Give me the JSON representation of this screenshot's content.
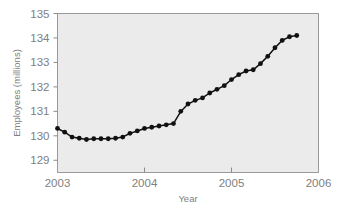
{
  "chart_data": {
    "type": "line",
    "title": "",
    "subtitle": "",
    "xlabel": "Year",
    "ylabel": "Employees (millions)",
    "xlim": [
      2003.0,
      2006.0
    ],
    "ylim": [
      128.5,
      135.0
    ],
    "xticks": [
      2003,
      2004,
      2005,
      2006
    ],
    "xtick_labels": [
      "2003",
      "2004",
      "2005",
      "2006"
    ],
    "yticks": [
      129,
      130,
      131,
      132,
      133,
      134,
      135
    ],
    "ytick_labels": [
      "129",
      "130",
      "131",
      "132",
      "133",
      "134",
      "135"
    ],
    "grid": false,
    "legend": "none",
    "markers": "filled-circle",
    "plot_background": "#ebebeb",
    "series_color": "#111111",
    "series": [
      {
        "name": "Employees",
        "x": [
          2003.0,
          2003.083,
          2003.167,
          2003.25,
          2003.333,
          2003.417,
          2003.5,
          2003.583,
          2003.667,
          2003.75,
          2003.833,
          2003.917,
          2004.0,
          2004.083,
          2004.167,
          2004.25,
          2004.333,
          2004.417,
          2004.5,
          2004.583,
          2004.667,
          2004.75,
          2004.833,
          2004.917,
          2005.0,
          2005.083,
          2005.167,
          2005.25,
          2005.333,
          2005.417,
          2005.5,
          2005.583,
          2005.667,
          2005.75
        ],
        "values": [
          130.3,
          130.15,
          129.95,
          129.9,
          129.85,
          129.88,
          129.88,
          129.88,
          129.9,
          129.95,
          130.1,
          130.2,
          130.3,
          130.35,
          130.4,
          130.45,
          130.5,
          131.0,
          131.3,
          131.45,
          131.55,
          131.75,
          131.9,
          132.05,
          132.3,
          132.5,
          132.65,
          132.7,
          132.95,
          133.25,
          133.6,
          133.9,
          134.05,
          134.1
        ]
      }
    ]
  },
  "axes": {
    "y_axis_title": "Employees (millions)",
    "x_axis_title": "Year"
  }
}
